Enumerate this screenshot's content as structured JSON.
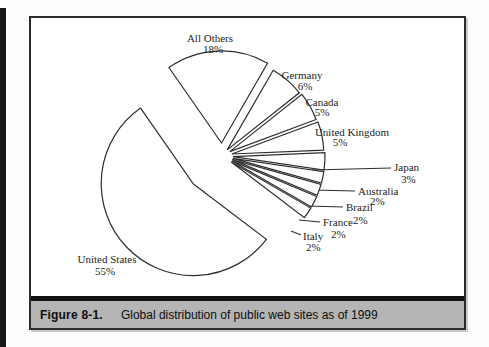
{
  "page": {
    "background": "#fdfdfd",
    "scan_edge_color": "#171717"
  },
  "figure": {
    "caption_label": "Figure 8-1.",
    "caption_text": "Global distribution of public web sites as of 1999",
    "frame_border_color": "#2c2c2c",
    "caption_bg": "#b5b5b5",
    "caption_rule_color": "#111111"
  },
  "chart_data": {
    "type": "pie",
    "title": "Global distribution of public web sites as of 1999",
    "value_unit": "percent",
    "start_angle_deg": 124.8,
    "direction": "clockwise",
    "stroke_color": "#2e2e2e",
    "fill_color": "#ffffff",
    "label_color": "#1d1d1d",
    "legend": "none",
    "slices": [
      {
        "label": "All Others",
        "value": 18,
        "pct_label": "18%",
        "explode": 13,
        "name_pos": [
          210,
          42
        ],
        "name_anchor": "middle",
        "pct_pos": [
          213,
          53
        ],
        "pct_anchor": "middle"
      },
      {
        "label": "Germany",
        "value": 6,
        "pct_label": "6%",
        "explode": 8,
        "name_pos": [
          302,
          79
        ],
        "name_anchor": "middle",
        "pct_pos": [
          305,
          90
        ],
        "pct_anchor": "middle"
      },
      {
        "label": "Canada",
        "value": 5,
        "pct_label": "5%",
        "explode": 9,
        "name_pos": [
          322,
          106
        ],
        "name_anchor": "middle",
        "pct_pos": [
          322,
          116
        ],
        "pct_anchor": "middle"
      },
      {
        "label": "United Kingdom",
        "value": 5,
        "pct_label": "5%",
        "explode": 10,
        "name_pos": [
          352,
          136
        ],
        "name_anchor": "middle",
        "pct_pos": [
          340,
          146
        ],
        "pct_anchor": "middle"
      },
      {
        "label": "Japan",
        "value": 3,
        "pct_label": "3%",
        "explode": 11,
        "name_pos": [
          394,
          171
        ],
        "name_anchor": "start",
        "pct_pos": [
          401,
          183
        ],
        "pct_anchor": "start",
        "leader": [
          312,
          170,
          391,
          168
        ]
      },
      {
        "label": "Australia",
        "value": 2,
        "pct_label": "2%",
        "explode": 11,
        "name_pos": [
          358,
          195
        ],
        "name_anchor": "start",
        "pct_pos": [
          370,
          205
        ],
        "pct_anchor": "start",
        "leader": [
          313,
          190,
          355,
          191
        ]
      },
      {
        "label": "Brazil",
        "value": 2,
        "pct_label": "2%",
        "explode": 11,
        "name_pos": [
          346,
          211
        ],
        "name_anchor": "start",
        "pct_pos": [
          353,
          224
        ],
        "pct_anchor": "start",
        "leader": [
          308,
          206,
          343,
          207
        ]
      },
      {
        "label": "France",
        "value": 2,
        "pct_label": "2%",
        "explode": 11,
        "name_pos": [
          323,
          226
        ],
        "name_anchor": "start",
        "pct_pos": [
          331,
          238
        ],
        "pct_anchor": "start",
        "leader": [
          299,
          220,
          320,
          222
        ]
      },
      {
        "label": "Italy",
        "value": 2,
        "pct_label": "2%",
        "explode": 11,
        "name_pos": [
          303,
          240
        ],
        "name_anchor": "start",
        "pct_pos": [
          306,
          251
        ],
        "pct_anchor": "start",
        "leader": [
          291,
          231,
          301,
          235
        ]
      },
      {
        "label": "United States",
        "value": 55,
        "pct_label": "55%",
        "explode": 40,
        "name_pos": [
          107,
          263
        ],
        "name_anchor": "middle",
        "pct_pos": [
          105,
          275
        ],
        "pct_anchor": "middle"
      }
    ],
    "layout": {
      "center": [
        222,
        156
      ],
      "radius": 92,
      "canvas": [
        489,
        347
      ],
      "label_font_px": 11
    }
  }
}
